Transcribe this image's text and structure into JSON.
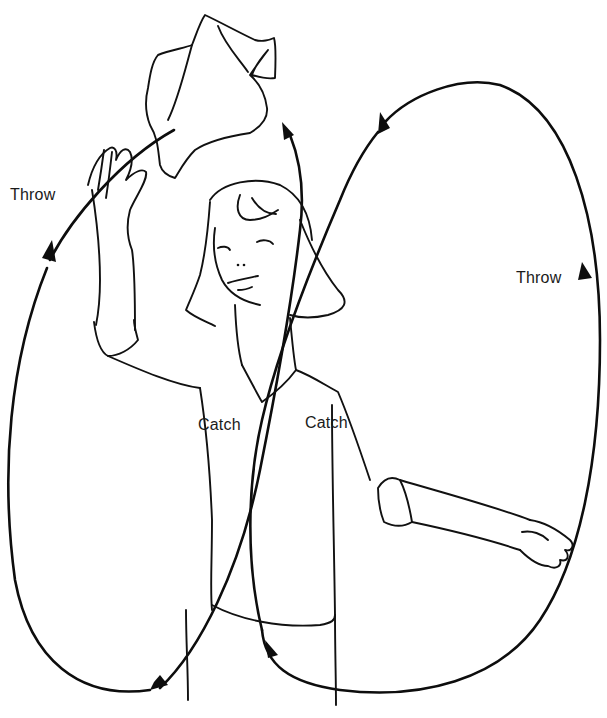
{
  "illustration": {
    "subject": "scarf juggling figure with two elliptical throw/catch paths",
    "labels": {
      "throw_left": "Throw",
      "throw_right": "Throw",
      "catch_left": "Catch",
      "catch_right": "Catch"
    },
    "colors": {
      "line": "#0d0d0d",
      "scarf_fill": "#d9d9d9",
      "background": "#ffffff"
    },
    "elements": [
      {
        "name": "scarf",
        "description": "stippled scarf floating above raised right hand"
      },
      {
        "name": "left-loop",
        "description": "tall ellipse on left side, arrows upward on left, downward through body"
      },
      {
        "name": "right-loop",
        "description": "tall ellipse on right side, arrow downward on top-left, upward on right"
      },
      {
        "name": "person",
        "description": "girl with bob haircut, one hand raised, other hand extended right"
      }
    ]
  }
}
